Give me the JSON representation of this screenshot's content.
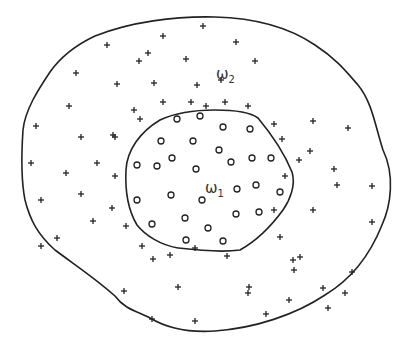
{
  "diagram": {
    "colors": {
      "stroke": "#222222",
      "background": "#ffffff"
    },
    "labels": {
      "omega1": {
        "symbol": "ω",
        "subscript": "1",
        "x": 205,
        "y": 193
      },
      "omega2": {
        "symbol": "ω",
        "subscript": "2",
        "x": 216,
        "y": 79
      }
    },
    "outer_boundary": "M 95 36 C 130 22, 175 16, 215 17 C 255 18, 290 28, 315 45 C 335 58, 345 70, 358 85 C 372 102, 375 125, 383 150 C 395 175, 391 205, 382 225 C 370 255, 350 280, 325 295 C 295 315, 255 328, 215 331 C 185 333, 165 327, 150 318 C 140 312, 125 310, 115 296 C 95 278, 75 265, 55 250 C 38 235, 30 220, 25 200 C 20 175, 22 145, 23 130 C 25 110, 38 90, 50 72 C 62 55, 78 44, 95 36 Z",
    "inner_boundary": "M 160 120 C 175 113, 195 110, 215 110 C 235 110, 250 112, 258 118 C 268 130, 283 150, 292 172 C 296 185, 290 200, 283 210 C 272 225, 258 240, 240 250 C 220 253, 195 250, 178 248 C 160 245, 145 235, 137 225 C 128 210, 125 190, 126 170 C 127 150, 140 132, 160 120 Z",
    "omega2_points_plus": [
      [
        203,
        26
      ],
      [
        163,
        36
      ],
      [
        236,
        42
      ],
      [
        107,
        45
      ],
      [
        148,
        53
      ],
      [
        186,
        59
      ],
      [
        139,
        61
      ],
      [
        255,
        61
      ],
      [
        76,
        73
      ],
      [
        197,
        85
      ],
      [
        117,
        84
      ],
      [
        221,
        80
      ],
      [
        154,
        83
      ],
      [
        69,
        106
      ],
      [
        134,
        110
      ],
      [
        163,
        102
      ],
      [
        191,
        102
      ],
      [
        225,
        102
      ],
      [
        206,
        106
      ],
      [
        248,
        106
      ],
      [
        140,
        119
      ],
      [
        274,
        124
      ],
      [
        113,
        135
      ],
      [
        36,
        126
      ],
      [
        81,
        137
      ],
      [
        115,
        137
      ],
      [
        313,
        121
      ],
      [
        282,
        139
      ],
      [
        348,
        128
      ],
      [
        310,
        151
      ],
      [
        299,
        160
      ],
      [
        97,
        163
      ],
      [
        31,
        163
      ],
      [
        66,
        173
      ],
      [
        115,
        176
      ],
      [
        334,
        169
      ],
      [
        285,
        176
      ],
      [
        41,
        200
      ],
      [
        81,
        194
      ],
      [
        112,
        208
      ],
      [
        337,
        185
      ],
      [
        274,
        210
      ],
      [
        372,
        186
      ],
      [
        313,
        210
      ],
      [
        93,
        221
      ],
      [
        126,
        226
      ],
      [
        142,
        246
      ],
      [
        57,
        238
      ],
      [
        41,
        246
      ],
      [
        170,
        255
      ],
      [
        195,
        248
      ],
      [
        153,
        259
      ],
      [
        227,
        256
      ],
      [
        300,
        257
      ],
      [
        372,
        222
      ],
      [
        249,
        287
      ],
      [
        323,
        288
      ],
      [
        124,
        291
      ],
      [
        352,
        272
      ],
      [
        328,
        308
      ],
      [
        152,
        319
      ],
      [
        195,
        321
      ],
      [
        266,
        314
      ],
      [
        248,
        293
      ],
      [
        289,
        300
      ],
      [
        293,
        260
      ],
      [
        345,
        293
      ],
      [
        178,
        287
      ],
      [
        280,
        237
      ],
      [
        294,
        270
      ]
    ],
    "omega1_points_circle": [
      [
        177,
        119
      ],
      [
        200,
        116
      ],
      [
        223,
        127
      ],
      [
        250,
        129
      ],
      [
        161,
        141
      ],
      [
        193,
        141
      ],
      [
        219,
        150
      ],
      [
        172,
        158
      ],
      [
        137,
        165
      ],
      [
        157,
        166
      ],
      [
        196,
        169
      ],
      [
        231,
        162
      ],
      [
        252,
        158
      ],
      [
        271,
        158
      ],
      [
        237,
        189
      ],
      [
        256,
        185
      ],
      [
        280,
        192
      ],
      [
        137,
        200
      ],
      [
        171,
        195
      ],
      [
        202,
        200
      ],
      [
        236,
        214
      ],
      [
        259,
        212
      ],
      [
        185,
        218
      ],
      [
        152,
        224
      ],
      [
        208,
        228
      ],
      [
        186,
        240
      ],
      [
        223,
        241
      ]
    ]
  }
}
